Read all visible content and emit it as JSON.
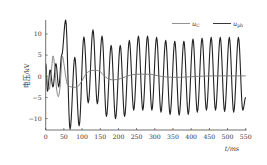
{
  "chart_data": {
    "type": "line",
    "title": "",
    "xlabel": "t/ms",
    "ylabel": "电压/kV",
    "xlim": [
      0,
      550
    ],
    "ylim": [
      -12.6,
      13.5
    ],
    "x_ticks": [
      0,
      50,
      100,
      150,
      200,
      250,
      300,
      350,
      400,
      450,
      500,
      550
    ],
    "y_ticks": [
      -10,
      -5,
      0,
      5,
      10
    ],
    "grid": false,
    "legend_position": "top-right",
    "series": [
      {
        "name": "u_C",
        "color": "#777777",
        "points": [
          [
            0,
            2.5
          ],
          [
            5,
            -2
          ],
          [
            10,
            -3
          ],
          [
            15,
            0.5
          ],
          [
            20,
            4.8
          ],
          [
            25,
            2
          ],
          [
            30,
            -3
          ],
          [
            35,
            -4.8
          ],
          [
            40,
            -2
          ],
          [
            45,
            4.5
          ],
          [
            50,
            3
          ],
          [
            55,
            0
          ],
          [
            60,
            -2
          ],
          [
            70,
            -2.5
          ],
          [
            80,
            -2.6
          ],
          [
            90,
            -2.3
          ],
          [
            100,
            -1
          ],
          [
            110,
            0.5
          ],
          [
            120,
            1.2
          ],
          [
            130,
            1.4
          ],
          [
            140,
            1.4
          ],
          [
            150,
            1.1
          ],
          [
            160,
            0.2
          ],
          [
            170,
            -0.5
          ],
          [
            180,
            -0.8
          ],
          [
            190,
            -0.8
          ],
          [
            200,
            -0.7
          ],
          [
            210,
            -0.4
          ],
          [
            220,
            -0.1
          ],
          [
            230,
            0.2
          ],
          [
            240,
            0.4
          ],
          [
            250,
            0.5
          ],
          [
            260,
            0.5
          ],
          [
            270,
            0.5
          ],
          [
            280,
            0.5
          ],
          [
            290,
            0.45
          ],
          [
            300,
            0.3
          ],
          [
            310,
            0.1
          ],
          [
            320,
            -0.05
          ],
          [
            330,
            -0.15
          ],
          [
            340,
            -0.2
          ],
          [
            360,
            -0.25
          ],
          [
            380,
            -0.2
          ],
          [
            400,
            -0.1
          ],
          [
            420,
            0
          ],
          [
            440,
            0.05
          ],
          [
            460,
            0.1
          ],
          [
            480,
            0.1
          ],
          [
            500,
            0.1
          ],
          [
            520,
            0.1
          ],
          [
            550,
            0.1
          ]
        ]
      },
      {
        "name": "u_ph",
        "color": "#222222",
        "period_ms": 25,
        "extrema": [
          [
            0,
            3
          ],
          [
            5,
            -3.5
          ],
          [
            12,
            1.5
          ],
          [
            20,
            -2.5
          ],
          [
            28,
            3
          ],
          [
            36,
            -2.5
          ],
          [
            44,
            5
          ],
          [
            55,
            13.3
          ],
          [
            67,
            -12.5
          ],
          [
            80,
            4.5
          ],
          [
            92,
            -11.7
          ],
          [
            105,
            9.3
          ],
          [
            117,
            -6.3
          ],
          [
            130,
            11
          ],
          [
            142,
            -6.5
          ],
          [
            155,
            9.5
          ],
          [
            167,
            -9.5
          ],
          [
            180,
            7.3
          ],
          [
            192,
            -10
          ],
          [
            205,
            7.3
          ],
          [
            217,
            -9.5
          ],
          [
            230,
            8.5
          ],
          [
            242,
            -8
          ],
          [
            255,
            9.5
          ],
          [
            267,
            -8
          ],
          [
            280,
            9.5
          ],
          [
            292,
            -8
          ],
          [
            305,
            9.2
          ],
          [
            317,
            -8.5
          ],
          [
            330,
            8.5
          ],
          [
            342,
            -9
          ],
          [
            355,
            8.3
          ],
          [
            367,
            -9.2
          ],
          [
            380,
            8.3
          ],
          [
            392,
            -9
          ],
          [
            405,
            8.8
          ],
          [
            417,
            -8.5
          ],
          [
            430,
            9
          ],
          [
            442,
            -8
          ],
          [
            455,
            9.2
          ],
          [
            467,
            -8
          ],
          [
            480,
            9.2
          ],
          [
            492,
            -8.3
          ],
          [
            505,
            9.2
          ],
          [
            517,
            -8.5
          ],
          [
            530,
            9.2
          ],
          [
            542,
            -8
          ],
          [
            550,
            -5
          ]
        ]
      }
    ]
  },
  "legend": {
    "items": [
      {
        "label": "u",
        "subscript": "C",
        "color": "#777777"
      },
      {
        "label": "u",
        "subscript": "ph",
        "color": "#222222"
      }
    ]
  },
  "axes": {
    "x_title": "t/ms",
    "y_title": "电压/kV"
  }
}
